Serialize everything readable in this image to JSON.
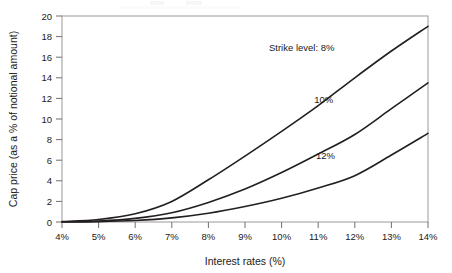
{
  "chart_data": {
    "type": "line",
    "title": "",
    "xlabel": "Interest rates (%)",
    "ylabel": "Cap price (as a % of notional amount)",
    "xlim": [
      4,
      14
    ],
    "ylim": [
      0,
      20
    ],
    "grid": false,
    "legend_position": "inline-annotations",
    "x_tick_labels": [
      "4%",
      "5%",
      "6%",
      "7%",
      "8%",
      "9%",
      "10%",
      "11%",
      "12%",
      "13%",
      "14%"
    ],
    "x_tick_values": [
      4,
      5,
      6,
      7,
      8,
      9,
      10,
      11,
      12,
      13,
      14
    ],
    "y_tick_labels": [
      "0",
      "2",
      "4",
      "6",
      "8",
      "10",
      "12",
      "14",
      "16",
      "18",
      "20"
    ],
    "y_tick_values": [
      0,
      2,
      4,
      6,
      8,
      10,
      12,
      14,
      16,
      18,
      20
    ],
    "x": [
      4,
      5,
      6,
      7,
      8,
      9,
      10,
      11,
      12,
      13,
      14
    ],
    "series": [
      {
        "name": "Strike level: 8%",
        "strike": "8%",
        "color": "#231f20",
        "values": [
          0.05,
          0.25,
          0.8,
          2.0,
          4.1,
          6.4,
          8.8,
          11.3,
          14.0,
          16.6,
          19.0
        ]
      },
      {
        "name": "10%",
        "strike": "10%",
        "color": "#231f20",
        "values": [
          0.02,
          0.1,
          0.35,
          0.9,
          1.9,
          3.2,
          4.8,
          6.6,
          8.5,
          11.0,
          13.5
        ]
      },
      {
        "name": "12%",
        "strike": "12%",
        "color": "#231f20",
        "values": [
          0.0,
          0.04,
          0.15,
          0.4,
          0.85,
          1.5,
          2.3,
          3.3,
          4.5,
          6.5,
          8.6
        ]
      }
    ],
    "annotations": [
      {
        "text": "Strike level: 8%",
        "x": 10.55,
        "y": 16.6,
        "anchor": "middle"
      },
      {
        "text": "10%",
        "x": 11.15,
        "y": 11.6,
        "anchor": "middle"
      },
      {
        "text": "12%",
        "x": 11.2,
        "y": 6.1,
        "anchor": "middle"
      }
    ]
  },
  "axes": {
    "x_title": "Interest rates (%)",
    "y_title": "Cap price (as a % of notional amount)"
  }
}
